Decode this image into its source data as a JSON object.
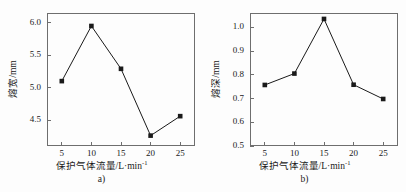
{
  "figure": {
    "background_color": "#fdfdfd",
    "frame_color": "#6e6e6e",
    "line_color": "#1a1a1a",
    "marker_color": "#1a1a1a"
  },
  "chart_data": [
    {
      "type": "line",
      "panel_label": "a)",
      "title": "",
      "xlabel_main": "保护气体流量/L·min",
      "xlabel_exponent": "-1",
      "ylabel": "熔宽/mm",
      "x": [
        5,
        10,
        15,
        20,
        25
      ],
      "values": [
        5.1,
        5.95,
        5.29,
        4.26,
        4.56
      ],
      "xticks": [
        "5",
        "10",
        "15",
        "20",
        "25"
      ],
      "yticks": [
        "4.5",
        "5.0",
        "5.5",
        "6.0"
      ],
      "ytick_values": [
        4.5,
        5.0,
        5.5,
        6.0
      ],
      "xlim": [
        2.5,
        27.5
      ],
      "ylim": [
        4.1,
        6.15
      ],
      "grid": false,
      "legend": "none",
      "marker": "square"
    },
    {
      "type": "line",
      "panel_label": "b)",
      "title": "",
      "xlabel_main": "保护气体流量/L·min",
      "xlabel_exponent": "-1",
      "ylabel": "熔深/mm",
      "x": [
        5,
        10,
        15,
        20,
        25
      ],
      "values": [
        0.757,
        0.805,
        1.035,
        0.758,
        0.698
      ],
      "xticks": [
        "5",
        "10",
        "15",
        "20",
        "25"
      ],
      "yticks": [
        "0.5",
        "0.6",
        "0.7",
        "0.8",
        "0.9",
        "1.0"
      ],
      "ytick_values": [
        0.5,
        0.6,
        0.7,
        0.8,
        0.9,
        1.0
      ],
      "xlim": [
        2.5,
        27.5
      ],
      "ylim": [
        0.5,
        1.06
      ],
      "grid": false,
      "legend": "none",
      "marker": "square"
    }
  ]
}
